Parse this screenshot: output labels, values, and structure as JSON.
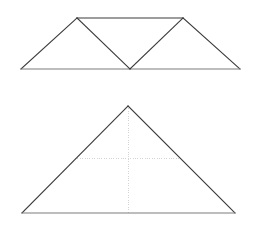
{
  "page": {
    "background_color": "#ffffff",
    "width": 258,
    "height": 231
  },
  "style": {
    "solid_line_color": "#3a3a3a",
    "baseline_color": "#7d7d7d",
    "dotted_line_color": "#cfcfcf",
    "fill_color": "#ffffff",
    "solid_line_width": 1.1,
    "dotted_line_width": 0.9,
    "dotted_dash_pattern": "1 1.4"
  },
  "figures": [
    {
      "id": "figure-top",
      "name": "unfolded-net-three-triangles",
      "description": "Trapezoid net made of three triangles sharing a common horizontal base, with a zig-zag fold line",
      "vertices": {
        "base_left": [
          21,
          69
        ],
        "peak_left": [
          77,
          18
        ],
        "peak_right": [
          183,
          18
        ],
        "base_right": [
          240,
          69
        ],
        "base_middle": [
          130,
          69
        ]
      },
      "edges": [
        {
          "name": "outer-left-slant",
          "from": "base_left",
          "to": "peak_left",
          "style": "solid"
        },
        {
          "name": "top-edge",
          "from": "peak_left",
          "to": "peak_right",
          "style": "solid"
        },
        {
          "name": "outer-right-slant",
          "from": "peak_right",
          "to": "base_right",
          "style": "solid"
        },
        {
          "name": "base-edge",
          "from": "base_right",
          "to": "base_left",
          "style": "solid"
        },
        {
          "name": "fold-left-diagonal",
          "from": "peak_left",
          "to": "base_middle",
          "style": "solid"
        },
        {
          "name": "fold-right-diagonal",
          "from": "base_middle",
          "to": "peak_right",
          "style": "solid"
        }
      ]
    },
    {
      "id": "figure-bottom",
      "name": "folded-triangle-with-construction-lines",
      "description": "Large isosceles triangle with dotted altitude from apex to base and a dotted horizontal midline",
      "vertices": {
        "apex": [
          128,
          106
        ],
        "base_left": [
          22,
          213
        ],
        "base_right": [
          235,
          213
        ],
        "base_foot": [
          128,
          213
        ],
        "midline_left": [
          75,
          158
        ],
        "midline_right": [
          181,
          158
        ]
      },
      "edges": [
        {
          "name": "left-slant",
          "from": "base_left",
          "to": "apex",
          "style": "solid"
        },
        {
          "name": "right-slant",
          "from": "apex",
          "to": "base_right",
          "style": "solid"
        },
        {
          "name": "base-edge",
          "from": "base_right",
          "to": "base_left",
          "style": "solid"
        },
        {
          "name": "altitude",
          "from": "apex",
          "to": "base_foot",
          "style": "dotted"
        },
        {
          "name": "midline",
          "from": "midline_left",
          "to": "midline_right",
          "style": "dotted"
        }
      ]
    }
  ]
}
